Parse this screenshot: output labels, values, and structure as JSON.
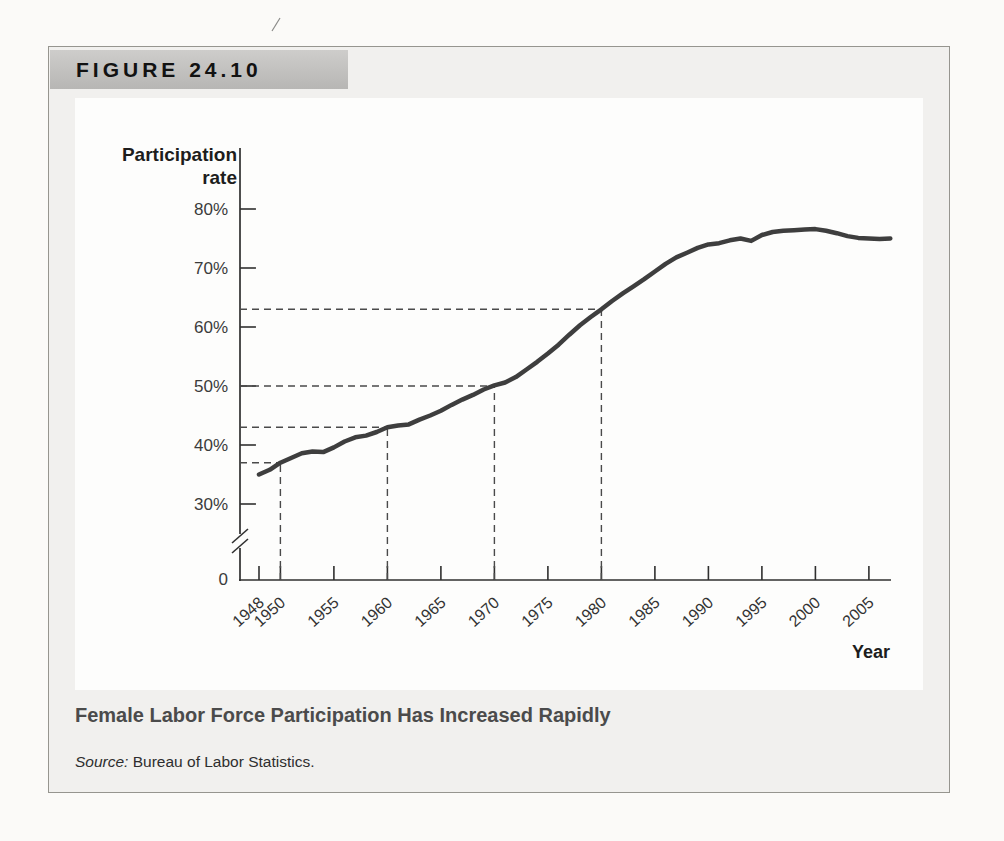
{
  "figure": {
    "label": "FIGURE 24.10",
    "caption": "Female Labor Force Participation Has Increased Rapidly",
    "source_prefix": "Source:",
    "source_text": " Bureau of Labor Statistics."
  },
  "colors": {
    "curve": "#3e3e3e",
    "axis": "#2f2f2f",
    "dashed": "#4a4a4a",
    "figure_bg": "#f1f0ee",
    "header_bar": "#bdbcba",
    "panel_bg": "#fdfdfc",
    "caption_text": "#4b4b4b"
  },
  "chart_data": {
    "type": "line",
    "title": "",
    "ylabel": "Participation rate",
    "ylabel_lines": [
      "Participation",
      "rate"
    ],
    "xlabel": "Year",
    "origin_label": "0",
    "y_axis_break": true,
    "grid": false,
    "legend": false,
    "y_ticks": [
      30,
      40,
      50,
      60,
      70,
      80
    ],
    "y_tick_labels": [
      "30%",
      "40%",
      "50%",
      "60%",
      "70%",
      "80%"
    ],
    "x_ticks": [
      1948,
      1950,
      1955,
      1960,
      1965,
      1970,
      1975,
      1980,
      1985,
      1990,
      1995,
      2000,
      2005
    ],
    "x_range": [
      1948,
      2007
    ],
    "y_display_range": [
      30,
      83
    ],
    "reference_points": [
      {
        "year": 1950,
        "rate": 37
      },
      {
        "year": 1960,
        "rate": 43
      },
      {
        "year": 1970,
        "rate": 50
      },
      {
        "year": 1980,
        "rate": 63
      }
    ],
    "series": [
      {
        "name": "Female labor force participation rate (%)",
        "points": [
          [
            1948,
            35.0
          ],
          [
            1949,
            35.8
          ],
          [
            1950,
            37.0
          ],
          [
            1951,
            37.8
          ],
          [
            1952,
            38.6
          ],
          [
            1953,
            38.9
          ],
          [
            1954,
            38.8
          ],
          [
            1955,
            39.6
          ],
          [
            1956,
            40.6
          ],
          [
            1957,
            41.3
          ],
          [
            1958,
            41.6
          ],
          [
            1959,
            42.2
          ],
          [
            1960,
            43.0
          ],
          [
            1961,
            43.3
          ],
          [
            1962,
            43.5
          ],
          [
            1963,
            44.3
          ],
          [
            1964,
            45.0
          ],
          [
            1965,
            45.8
          ],
          [
            1966,
            46.8
          ],
          [
            1967,
            47.7
          ],
          [
            1968,
            48.5
          ],
          [
            1969,
            49.4
          ],
          [
            1970,
            50.1
          ],
          [
            1971,
            50.6
          ],
          [
            1972,
            51.5
          ],
          [
            1973,
            52.8
          ],
          [
            1974,
            54.1
          ],
          [
            1975,
            55.5
          ],
          [
            1976,
            57.0
          ],
          [
            1977,
            58.7
          ],
          [
            1978,
            60.3
          ],
          [
            1979,
            61.7
          ],
          [
            1980,
            63.0
          ],
          [
            1981,
            64.4
          ],
          [
            1982,
            65.7
          ],
          [
            1983,
            66.9
          ],
          [
            1984,
            68.1
          ],
          [
            1985,
            69.4
          ],
          [
            1986,
            70.7
          ],
          [
            1987,
            71.8
          ],
          [
            1988,
            72.6
          ],
          [
            1989,
            73.4
          ],
          [
            1990,
            74.0
          ],
          [
            1991,
            74.2
          ],
          [
            1992,
            74.7
          ],
          [
            1993,
            75.0
          ],
          [
            1994,
            74.6
          ],
          [
            1995,
            75.6
          ],
          [
            1996,
            76.1
          ],
          [
            1997,
            76.3
          ],
          [
            1998,
            76.4
          ],
          [
            1999,
            76.5
          ],
          [
            2000,
            76.6
          ],
          [
            2001,
            76.3
          ],
          [
            2002,
            75.9
          ],
          [
            2003,
            75.4
          ],
          [
            2004,
            75.1
          ],
          [
            2005,
            75.0
          ],
          [
            2006,
            74.9
          ],
          [
            2007,
            75.0
          ]
        ]
      }
    ]
  }
}
